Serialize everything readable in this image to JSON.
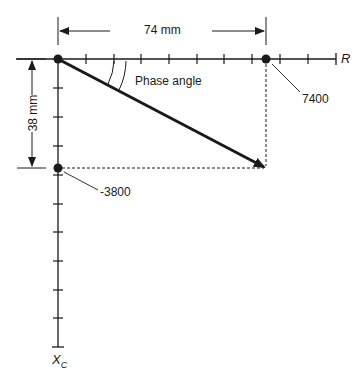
{
  "diagram": {
    "type": "phasor-impedance-diagram",
    "axes": {
      "horizontal": {
        "label": "R"
      },
      "vertical": {
        "label": "X",
        "label_subscript": "C"
      }
    },
    "dimensions": {
      "horizontal": "74 mm",
      "vertical": "38 mm"
    },
    "points": {
      "resistance": {
        "value": "7400"
      },
      "reactance": {
        "value": "-3800"
      }
    },
    "angle_label": "Phase angle",
    "colors": {
      "line": "#1a1a1a",
      "background": "#ffffff"
    }
  }
}
